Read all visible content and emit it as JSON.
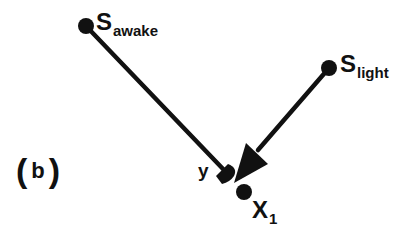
{
  "diagram": {
    "panel_label": {
      "open": "(",
      "letter": "b",
      "close": ")"
    },
    "nodes": [
      {
        "id": "s_awake",
        "label_main": "S",
        "label_sub": "awake",
        "x": 86,
        "y": 26
      },
      {
        "id": "s_light",
        "label_main": "S",
        "label_sub": "light",
        "x": 329,
        "y": 68
      },
      {
        "id": "x1",
        "label_main": "X",
        "label_sub": "1",
        "x": 244,
        "y": 192
      }
    ],
    "target_label": "y",
    "edges": [
      {
        "from": "s_awake",
        "to": "y",
        "head": "half-round"
      },
      {
        "from": "s_light",
        "to": "y",
        "head": "triangle"
      }
    ],
    "colors": {
      "ink": "#111111",
      "background": "#ffffff"
    }
  }
}
